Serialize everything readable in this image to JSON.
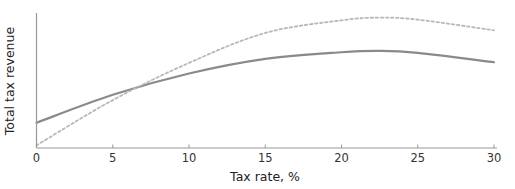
{
  "figure": {
    "background": "#ffffff"
  },
  "chart_data": {
    "type": "line",
    "title": "",
    "xlabel": "Tax rate, %",
    "ylabel": "Total tax revenue",
    "xlim": [
      0,
      30
    ],
    "ylim": [
      0,
      100
    ],
    "x_ticks": [
      0,
      5,
      10,
      15,
      20,
      25,
      30
    ],
    "grid": false,
    "legend": "none",
    "x": [
      0,
      5,
      10,
      15,
      20,
      22.5,
      25,
      30
    ],
    "series": [
      {
        "name": "solid-revenue-curve",
        "style": "solid",
        "color": "#8a8a8a",
        "stroke_width": 2.2,
        "dash": "",
        "values": [
          19,
          40,
          56,
          67,
          72,
          73,
          71.5,
          64.5
        ]
      },
      {
        "name": "dotted-revenue-curve",
        "style": "dotted",
        "color": "#b8b8b8",
        "stroke_width": 1.8,
        "dash": "2.5 2.6",
        "values": [
          2,
          36,
          64,
          86.5,
          96,
          98,
          96.5,
          88.5
        ]
      }
    ],
    "axis_color": "#999999",
    "tick_color": "#999999",
    "text_color": "#333333"
  }
}
